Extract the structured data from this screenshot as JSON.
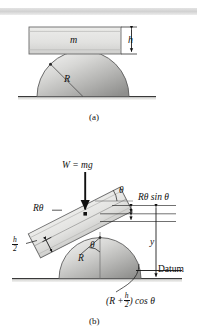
{
  "figure": {
    "background_color": "#ffffff",
    "ink_color": "#111111",
    "body_fill_light": "#e8e8e6",
    "body_fill_dark": "#9a9a9a",
    "top_band_color": "#d8d8d8",
    "ground_color": "#c9c9c7"
  },
  "panel_a": {
    "caption": "(a)",
    "block_label": "m",
    "height_label": "h",
    "radius_label": "R",
    "icons": {
      "block": "rectangular-block",
      "dome": "semicircle-dome",
      "ground": "ground-line",
      "dimension": "height-dimension-arrow"
    }
  },
  "panel_b": {
    "caption": "(b)",
    "weight_label": "W = mg",
    "arc_label": "Rθ",
    "angle_label_block": "θ",
    "angle_label_center": "θ",
    "vertical_component_label": "Rθ sin θ",
    "half_height_label": {
      "num": "h",
      "den": "2"
    },
    "radius_label": "R",
    "height_label": "y",
    "datum_label": "Datum",
    "cos_expression": {
      "prefix": "(R +",
      "num": "h",
      "den": "2",
      "suffix": ") cos θ"
    },
    "icons": {
      "tilted-block": "tilted-rectangular-block",
      "weight-arrow": "downward-force-arrow",
      "dome": "semicircle-dome",
      "ground": "ground-line",
      "datum-line": "datum-reference-line",
      "leader": "leader-line",
      "dimension-y": "vertical-dimension-arrow"
    }
  }
}
